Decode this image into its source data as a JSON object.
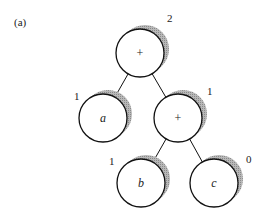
{
  "figure": {
    "panel_label": "(a)",
    "colors": {
      "stroke": "#111111",
      "shadow": "#9a9a9a",
      "background": "#ffffff",
      "text": "#222222"
    },
    "nodes": [
      {
        "id": "root",
        "label": "+",
        "italic": false,
        "cx": 140,
        "cy": 53,
        "r": 24,
        "count": "2",
        "count_x": 167,
        "count_y": 22
      },
      {
        "id": "a",
        "label": "a",
        "italic": true,
        "cx": 103,
        "cy": 118,
        "r": 24,
        "count": "1",
        "count_x": 74,
        "count_y": 100
      },
      {
        "id": "plus2",
        "label": "+",
        "italic": false,
        "cx": 178,
        "cy": 118,
        "r": 24,
        "count": "1",
        "count_x": 207,
        "count_y": 95
      },
      {
        "id": "b",
        "label": "b",
        "italic": true,
        "cx": 141,
        "cy": 183,
        "r": 24,
        "count": "1",
        "count_x": 109,
        "count_y": 165
      },
      {
        "id": "c",
        "label": "c",
        "italic": true,
        "cx": 214,
        "cy": 183,
        "r": 24,
        "count": "0",
        "count_x": 246,
        "count_y": 163
      }
    ],
    "edges": [
      {
        "from": "root",
        "to": "a"
      },
      {
        "from": "root",
        "to": "plus2"
      },
      {
        "from": "plus2",
        "to": "b"
      },
      {
        "from": "plus2",
        "to": "c"
      }
    ]
  }
}
